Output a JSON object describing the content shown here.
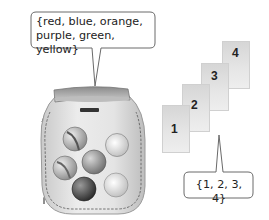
{
  "colors_callout": {
    "lines": [
      "{red, blue, orange,",
      "purple, green, yellow}"
    ]
  },
  "numbers_callout": {
    "text": "{1, 2, 3, 4}"
  },
  "cards": [
    {
      "label": "1"
    },
    {
      "label": "2"
    },
    {
      "label": "3"
    },
    {
      "label": "4"
    }
  ],
  "bag": {
    "marble_count": 6
  }
}
